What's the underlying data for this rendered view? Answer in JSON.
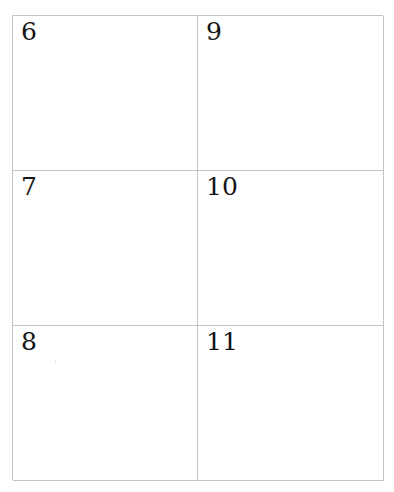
{
  "page": {
    "layout": "2 columns x 3 rows grid of numbered boxes",
    "border_color": "#c4c4c4",
    "text_color": "#151515"
  },
  "cells": [
    {
      "label": "6"
    },
    {
      "label": "7"
    },
    {
      "label": "8"
    },
    {
      "label": "9"
    },
    {
      "label": "10"
    },
    {
      "label": "11"
    }
  ]
}
